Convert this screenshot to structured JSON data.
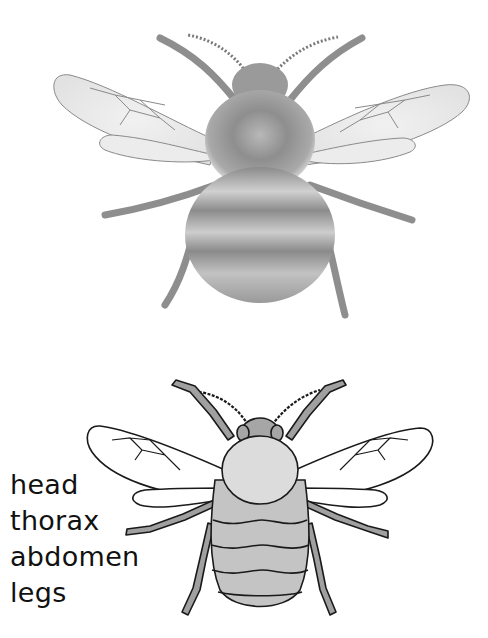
{
  "diagram": {
    "top_image": "realistic-pencil-drawing-of-bumblebee",
    "bottom_image": "simplified-labelled-bumblebee-outline",
    "labels": [
      {
        "text": "head"
      },
      {
        "text": "thorax"
      },
      {
        "text": "abdomen"
      },
      {
        "text": "legs"
      }
    ],
    "colors": {
      "background": "#ffffff",
      "outline": "#1a1a1a",
      "thorax_fill": "#dcdcdc",
      "head_fill": "#a6a6a6",
      "abdomen_fill": "#c4c4c4",
      "legs_fill": "#a0a0a0",
      "pencil_dark": "#6e6e6e",
      "pencil_light": "#cfcfcf"
    }
  }
}
